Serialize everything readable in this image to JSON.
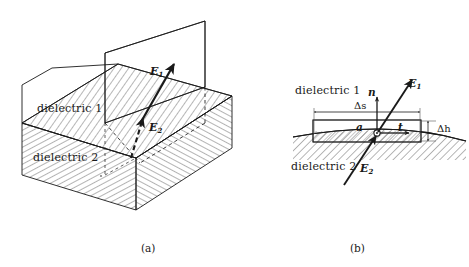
{
  "figure": {
    "panels": [
      {
        "id": "a",
        "caption": "(a)",
        "type": "3d-interface-block",
        "labels": {
          "dielectric_upper": "dielectric 1",
          "dielectric_lower": "dielectric 2",
          "field_upper": "E",
          "field_upper_sub": "1",
          "field_lower": "E",
          "field_lower_sub": "2"
        }
      },
      {
        "id": "b",
        "caption": "(b)",
        "type": "2d-boundary-loop",
        "labels": {
          "dielectric_upper": "dielectric 1",
          "dielectric_lower": "dielectric 2",
          "normal_vector": "n",
          "tangent_vector": "t",
          "point": "a",
          "field_upper": "E",
          "field_upper_sub": "1",
          "field_lower": "E",
          "field_lower_sub": "2",
          "width_dimension": "Δs",
          "height_dimension": "Δh"
        }
      }
    ]
  },
  "colors": {
    "stroke": "#1a1a1a",
    "hatch": "#4a4a4a",
    "background": "#ffffff",
    "thin_rule": "#555555"
  }
}
